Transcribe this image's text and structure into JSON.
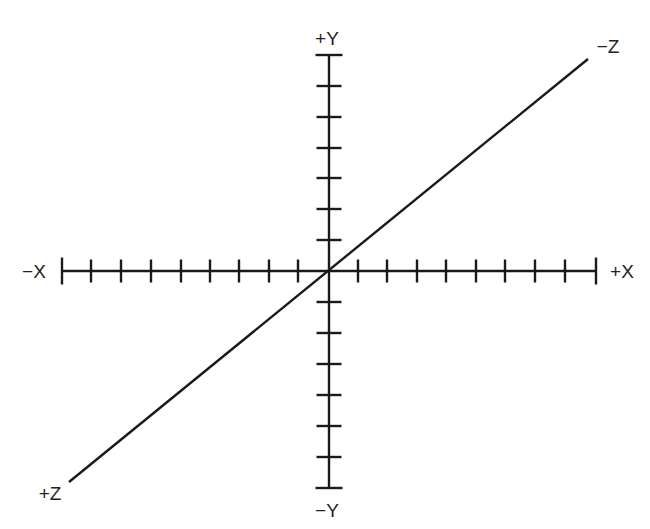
{
  "diagram": {
    "colors": {
      "background": "#ffffff",
      "line": "#1a1a1a",
      "text": "#222222"
    },
    "origin": {
      "x": 329,
      "y": 271
    },
    "x_axis": {
      "negative_label": "−X",
      "positive_label": "+X",
      "from_x": 62,
      "to_x": 596,
      "tick_positions": [
        62,
        91,
        121,
        151,
        181,
        210,
        239,
        269,
        298,
        358,
        387,
        417,
        446,
        476,
        505,
        535,
        565,
        596
      ],
      "tick_count_each_side": 9
    },
    "y_axis": {
      "positive_label": "+Y",
      "negative_label": "−Y",
      "from_y": 55,
      "to_y": 488,
      "tick_positions": [
        55,
        86,
        117,
        148,
        178,
        209,
        240,
        302,
        333,
        364,
        395,
        426,
        457,
        488
      ],
      "tick_count_each_side": 7
    },
    "z_axis": {
      "negative_label": "−Z",
      "positive_label": "+Z",
      "from": {
        "x": 588,
        "y": 59
      },
      "to": {
        "x": 69,
        "y": 482
      }
    }
  }
}
